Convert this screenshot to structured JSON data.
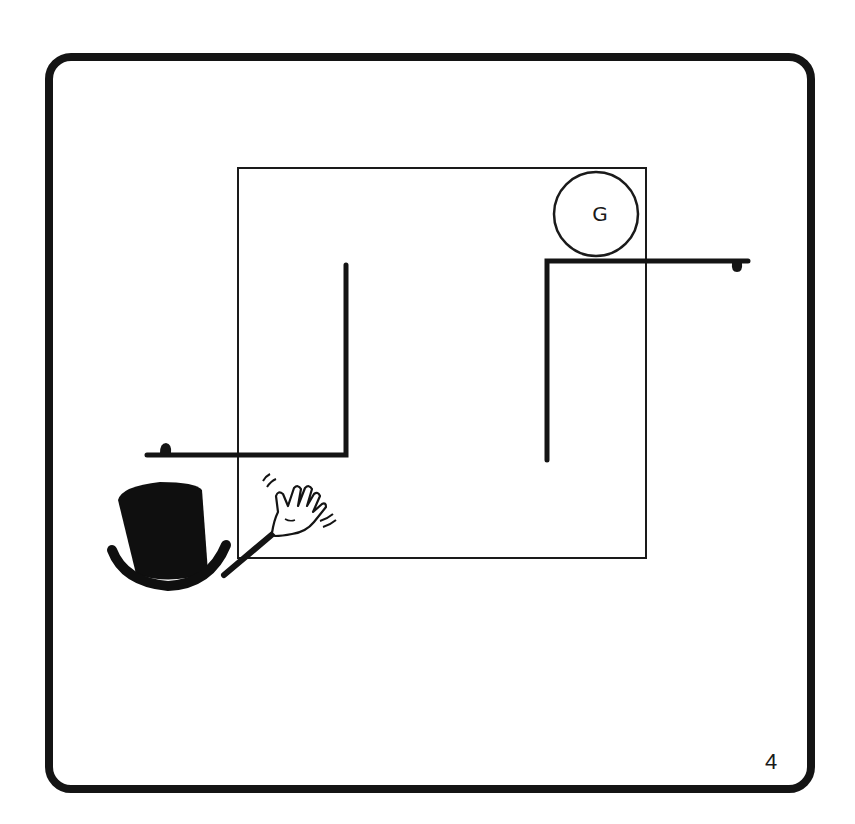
{
  "page": {
    "number": "4"
  },
  "puzzle": {
    "goal": {
      "label": "G",
      "shape": "circle",
      "center": [
        596,
        214
      ],
      "radius": 42
    },
    "board": {
      "outline": "thin-square",
      "bounds": {
        "left": 238,
        "top": 168,
        "right": 646,
        "bottom": 558
      }
    },
    "walls": [
      {
        "name": "left-wall",
        "shape": "L",
        "points": [
          [
            147,
            455
          ],
          [
            346,
            455
          ],
          [
            346,
            265
          ]
        ],
        "peg_at": [
          165,
          448
        ]
      },
      {
        "name": "right-wall",
        "shape": "L",
        "points": [
          [
            547,
            460
          ],
          [
            547,
            261
          ],
          [
            748,
            261
          ]
        ],
        "peg_at": [
          737,
          268
        ]
      }
    ],
    "player": {
      "icon": "top-hat-icon",
      "position": [
        165,
        530
      ]
    },
    "pointer": {
      "icon": "waving-hand-icon",
      "position": [
        295,
        505
      ]
    }
  },
  "colors": {
    "ink": "#141414",
    "background": "#ffffff"
  }
}
